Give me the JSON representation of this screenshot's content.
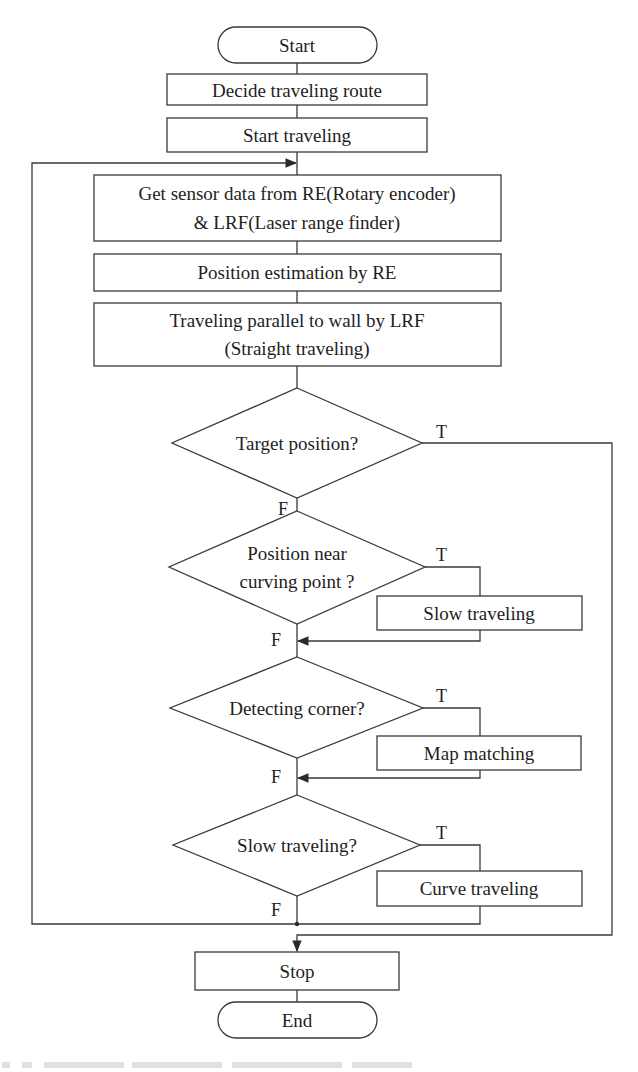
{
  "flowchart": {
    "nodes": {
      "start": {
        "type": "terminator",
        "label": "Start"
      },
      "decide_route": {
        "type": "process",
        "label": "Decide traveling route"
      },
      "start_traveling": {
        "type": "process",
        "label": "Start traveling"
      },
      "get_sensor_data": {
        "type": "process",
        "line1": "Get sensor data from RE(Rotary encoder)",
        "line2": "& LRF(Laser range finder)"
      },
      "position_estimation": {
        "type": "process",
        "label": "Position estimation by RE"
      },
      "traveling_parallel": {
        "type": "process",
        "line1": "Traveling parallel to wall by LRF",
        "line2": "(Straight traveling)"
      },
      "target_position": {
        "type": "decision",
        "label": "Target position?"
      },
      "near_curving_point": {
        "type": "decision",
        "line1": "Position near",
        "line2": "curving point ?"
      },
      "slow_traveling": {
        "type": "process",
        "label": "Slow traveling"
      },
      "detecting_corner": {
        "type": "decision",
        "label": "Detecting corner?"
      },
      "map_matching": {
        "type": "process",
        "label": "Map matching"
      },
      "slow_traveling_check": {
        "type": "decision",
        "label": "Slow traveling?"
      },
      "curve_traveling": {
        "type": "process",
        "label": "Curve traveling"
      },
      "stop": {
        "type": "process",
        "label": "Stop"
      },
      "end": {
        "type": "terminator",
        "label": "End"
      }
    },
    "branch_labels": {
      "true": "T",
      "false": "F"
    },
    "edges": [
      {
        "from": "start",
        "to": "decide_route"
      },
      {
        "from": "decide_route",
        "to": "start_traveling"
      },
      {
        "from": "start_traveling",
        "to": "get_sensor_data"
      },
      {
        "from": "get_sensor_data",
        "to": "position_estimation"
      },
      {
        "from": "position_estimation",
        "to": "traveling_parallel"
      },
      {
        "from": "traveling_parallel",
        "to": "target_position"
      },
      {
        "from": "target_position",
        "to": "stop",
        "label": "T"
      },
      {
        "from": "target_position",
        "to": "near_curving_point",
        "label": "F"
      },
      {
        "from": "near_curving_point",
        "to": "slow_traveling",
        "label": "T"
      },
      {
        "from": "slow_traveling",
        "to": "detecting_corner"
      },
      {
        "from": "near_curving_point",
        "to": "detecting_corner",
        "label": "F"
      },
      {
        "from": "detecting_corner",
        "to": "map_matching",
        "label": "T"
      },
      {
        "from": "map_matching",
        "to": "slow_traveling_check"
      },
      {
        "from": "detecting_corner",
        "to": "slow_traveling_check",
        "label": "F"
      },
      {
        "from": "slow_traveling_check",
        "to": "curve_traveling",
        "label": "T"
      },
      {
        "from": "slow_traveling_check",
        "to": "get_sensor_data",
        "label": "F",
        "note": "loop back"
      },
      {
        "from": "curve_traveling",
        "to": "get_sensor_data",
        "note": "loop back"
      },
      {
        "from": "stop",
        "to": "end"
      }
    ]
  },
  "colors": {
    "background": "#ffffff",
    "stroke": "#3a3a3a",
    "text": "#1e1e1e"
  }
}
